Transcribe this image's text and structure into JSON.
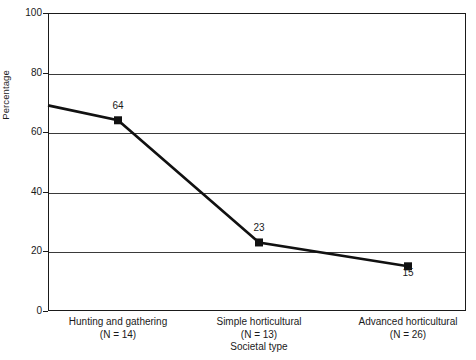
{
  "chart_data": {
    "type": "line",
    "title": "",
    "xlabel": "Societal type",
    "ylabel": "Percentage",
    "categories": [
      "Hunting and gathering",
      "Simple horticultural",
      "Advanced horticultural"
    ],
    "category_counts": [
      "(N = 14)",
      "(N = 13)",
      "(N = 26)"
    ],
    "values": [
      64,
      23,
      15
    ],
    "point_labels": [
      "64",
      "23",
      "15"
    ],
    "ylim": [
      0,
      100
    ],
    "y_ticks": [
      0,
      20,
      40,
      60,
      80,
      100
    ],
    "y_tick_labels": [
      "0",
      "20",
      "40",
      "60",
      "80",
      "100"
    ],
    "grid": true,
    "grid_axis": "y",
    "legend": "none",
    "marker": "square",
    "line_color": "#111111",
    "marker_color": "#111111",
    "grid_color": "#3a3a3a",
    "axis_color": "#1a1a1a",
    "background": "#ffffff",
    "line_start_value": 69
  }
}
